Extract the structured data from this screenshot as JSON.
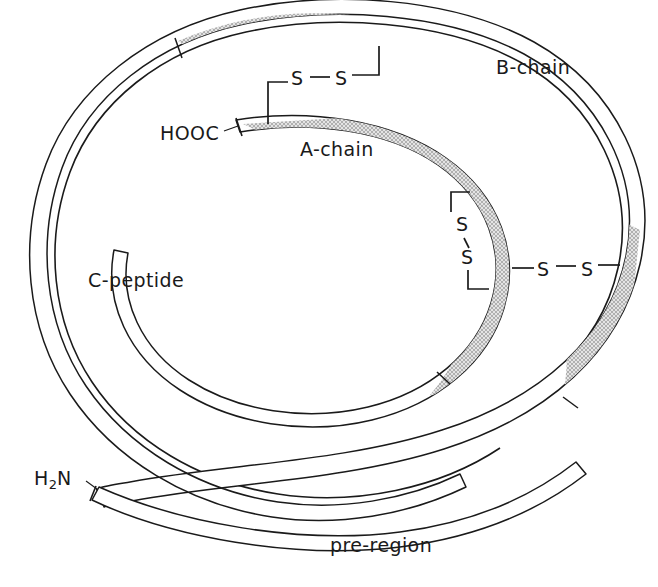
{
  "figure": {
    "background_color": "#ffffff",
    "line_color": "#1a1a1a",
    "shaded_fill_color": "#d9d9d9",
    "unshaded_fill_color": "#ffffff"
  },
  "labels": {
    "b_chain": "B-chain",
    "a_chain": "A-chain",
    "c_peptide": "C-peptide",
    "pre_region": "pre-region",
    "c_terminus": "HOOC",
    "n_terminus_main": "H",
    "n_terminus_sub": "2",
    "n_terminus_tail": "N"
  },
  "disulfide_bonds": [
    {
      "id": "bond-a7-b7",
      "label_left": "S",
      "label_right": "S",
      "orientation": "horizontal",
      "position": "top",
      "connects": [
        "A-chain",
        "B-chain"
      ]
    },
    {
      "id": "bond-a6-a11",
      "label_left": "S",
      "label_right": "S",
      "orientation": "vertical",
      "position": "inner-right",
      "connects": [
        "A-chain",
        "A-chain"
      ]
    },
    {
      "id": "bond-a20-b19",
      "label_left": "S",
      "label_right": "S",
      "orientation": "horizontal",
      "position": "right",
      "connects": [
        "A-chain",
        "B-chain"
      ]
    }
  ],
  "segments": [
    {
      "name": "B-chain",
      "shaded": true,
      "ring": "outer"
    },
    {
      "name": "C-peptide",
      "shaded": false,
      "ring": "outer-and-inner"
    },
    {
      "name": "A-chain",
      "shaded": true,
      "ring": "inner"
    },
    {
      "name": "pre-region",
      "shaded": false,
      "ring": "tail"
    }
  ]
}
